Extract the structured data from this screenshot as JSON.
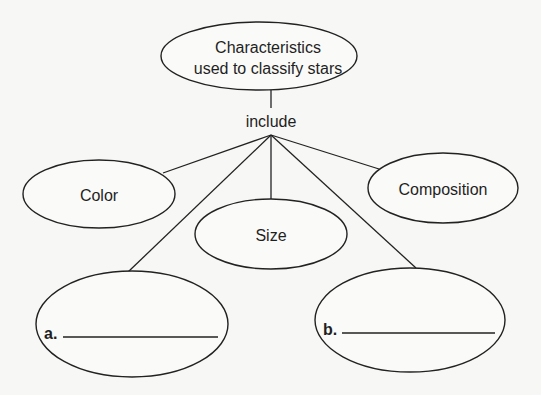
{
  "diagram": {
    "type": "concept-map",
    "root": {
      "line1": "Characteristics",
      "line2": "used to classify stars"
    },
    "connector_label": "include",
    "nodes": [
      {
        "id": "color",
        "label": "Color"
      },
      {
        "id": "size",
        "label": "Size"
      },
      {
        "id": "composition",
        "label": "Composition"
      }
    ],
    "blanks": [
      {
        "id": "a",
        "marker": "a.",
        "value": "",
        "placeholder": ""
      },
      {
        "id": "b",
        "marker": "b.",
        "value": "",
        "placeholder": ""
      }
    ],
    "colors": {
      "stroke": "#222222",
      "background": "#f7f7f5",
      "text": "#1f1f1f"
    }
  }
}
